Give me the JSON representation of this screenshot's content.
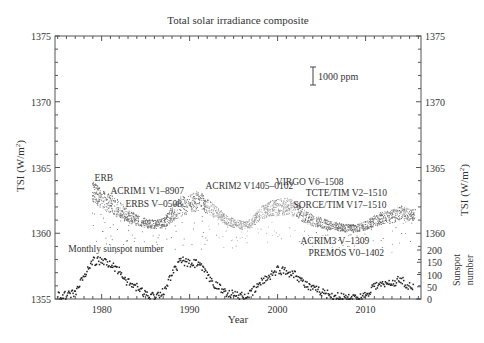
{
  "chart_data": {
    "type": "scatter",
    "title": "Total solar irradiance composite",
    "xlabel": "Year",
    "ylabel": "TSI (W/m²)",
    "ylabel_right": "TSI (W/m²)",
    "ylabel_right_secondary": "Sunspot number",
    "xlim": [
      1974.7,
      2016.3
    ],
    "ylim": [
      1355,
      1375
    ],
    "secondary_ylim": [
      0,
      200
    ],
    "x_ticks": [
      1980,
      1990,
      2000,
      2010
    ],
    "y_ticks": [
      1355,
      1360,
      1365,
      1370,
      1375
    ],
    "y_ticks_right": [
      1360,
      1365,
      1370,
      1375
    ],
    "secondary_y_ticks": [
      0,
      50,
      100,
      150,
      200
    ],
    "grid": false,
    "scale_bar_label": "1000 ppm",
    "annotations": [
      {
        "text": "ERB",
        "x": 1979.2,
        "y": 1364.0
      },
      {
        "text": "ACRIM1 V1–8907",
        "x": 1981.0,
        "y": 1363.0
      },
      {
        "text": "ERBS V–0508",
        "x": 1982.7,
        "y": 1362.0
      },
      {
        "text": "ACRIM2 V1405–0102",
        "x": 1991.8,
        "y": 1363.4
      },
      {
        "text": "VIRGO V6–1508",
        "x": 1999.8,
        "y": 1363.7
      },
      {
        "text": "TCTE/TIM V2–1510",
        "x": 2003.2,
        "y": 1362.8
      },
      {
        "text": "SORCE/TIM V17–1510",
        "x": 2001.8,
        "y": 1361.9
      },
      {
        "text": "ACRIM3 V–1309",
        "x": 2002.6,
        "y": 1359.2
      },
      {
        "text": "PREMOS V0–1402",
        "x": 2003.5,
        "y": 1358.3
      },
      {
        "text": "Monthly sunspot number",
        "x": 1976.2,
        "y": 1358.6
      }
    ],
    "series": [
      {
        "name": "TSI composite (daily)",
        "color": "#777777",
        "x": [
          1979.0,
          1980.0,
          1981.0,
          1982.0,
          1983.0,
          1984.0,
          1985.0,
          1986.0,
          1987.0,
          1988.0,
          1989.0,
          1990.0,
          1991.0,
          1992.0,
          1993.0,
          1994.0,
          1995.0,
          1996.0,
          1997.0,
          1998.0,
          1999.0,
          2000.0,
          2001.0,
          2002.0,
          2003.0,
          2004.0,
          2005.0,
          2006.0,
          2007.0,
          2008.0,
          2009.0,
          2010.0,
          2011.0,
          2012.0,
          2013.0,
          2014.0,
          2015.0
        ],
        "values": [
          1363.2,
          1362.6,
          1362.3,
          1361.8,
          1361.3,
          1361.0,
          1360.8,
          1360.7,
          1360.8,
          1361.5,
          1362.1,
          1362.3,
          1362.5,
          1362.1,
          1361.6,
          1361.1,
          1360.8,
          1360.6,
          1360.8,
          1361.5,
          1361.9,
          1362.0,
          1362.1,
          1361.9,
          1361.3,
          1361.0,
          1360.8,
          1360.6,
          1360.5,
          1360.4,
          1360.4,
          1360.6,
          1361.0,
          1361.2,
          1361.3,
          1361.6,
          1361.4
        ]
      },
      {
        "name": "Monthly sunspot number",
        "axis": "secondary",
        "color": "#222222",
        "x": [
          1975.0,
          1976.0,
          1977.0,
          1978.0,
          1979.0,
          1980.0,
          1981.0,
          1982.0,
          1983.0,
          1984.0,
          1985.0,
          1986.0,
          1987.0,
          1988.0,
          1989.0,
          1990.0,
          1991.0,
          1992.0,
          1993.0,
          1994.0,
          1995.0,
          1996.0,
          1997.0,
          1998.0,
          1999.0,
          2000.0,
          2001.0,
          2002.0,
          2003.0,
          2004.0,
          2005.0,
          2006.0,
          2007.0,
          2008.0,
          2009.0,
          2010.0,
          2011.0,
          2012.0,
          2013.0,
          2014.0,
          2015.0
        ],
        "values": [
          15,
          13,
          27,
          92,
          155,
          155,
          140,
          116,
          66,
          46,
          18,
          14,
          29,
          100,
          158,
          142,
          145,
          94,
          55,
          30,
          18,
          9,
          22,
          64,
          93,
          120,
          111,
          104,
          64,
          40,
          30,
          15,
          8,
          3,
          3,
          16,
          56,
          58,
          65,
          80,
          50
        ]
      }
    ]
  }
}
